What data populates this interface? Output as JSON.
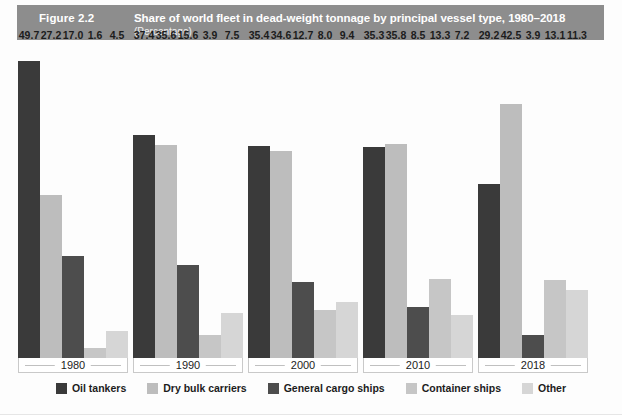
{
  "header": {
    "figure_number": "Figure 2.2",
    "title": "Share of world fleet in dead-weight tonnage by principal vessel type, 1980–2018",
    "subtitle": "(Percentage)",
    "banner_color": "#8d8d8d",
    "text_color": "#ffffff"
  },
  "chart_data": {
    "type": "bar",
    "title": "Share of world fleet in dead-weight tonnage by principal vessel type, 1980–2018",
    "subtitle": "(Percentage)",
    "xlabel": "",
    "ylabel": "",
    "ylim": [
      0,
      50
    ],
    "grid": false,
    "legend_position": "bottom",
    "value_labels": true,
    "categories": [
      "1980",
      "1990",
      "2000",
      "2010",
      "2018"
    ],
    "series": [
      {
        "name": "Oil tankers",
        "color": "#3a3a3a",
        "values": [
          49.7,
          37.4,
          35.4,
          35.3,
          29.2
        ]
      },
      {
        "name": "Dry bulk carriers",
        "color": "#bdbdbd",
        "values": [
          27.2,
          35.6,
          34.6,
          35.8,
          42.5
        ]
      },
      {
        "name": "General cargo ships",
        "color": "#4d4d4d",
        "values": [
          17.0,
          15.6,
          12.7,
          8.5,
          3.9
        ]
      },
      {
        "name": "Container ships",
        "color": "#c6c6c6",
        "values": [
          1.6,
          3.9,
          8.0,
          13.3,
          13.1
        ]
      },
      {
        "name": "Other",
        "color": "#d6d6d6",
        "values": [
          4.5,
          7.5,
          9.4,
          7.2,
          11.3
        ]
      }
    ],
    "value_labels_formatted": [
      [
        "49.7",
        "27.2",
        "17.0",
        "1.6",
        "4.5"
      ],
      [
        "37.4",
        "35.6",
        "15.6",
        "3.9",
        "7.5"
      ],
      [
        "35.4",
        "34.6",
        "12.7",
        "8.0",
        "9.4"
      ],
      [
        "35.3",
        "35.8",
        "8.5",
        "13.3",
        "7.2"
      ],
      [
        "29.2",
        "42.5",
        "3.9",
        "13.1",
        "11.3"
      ]
    ]
  },
  "legend": {
    "items": [
      {
        "label": "Oil tankers",
        "color": "#3a3a3a"
      },
      {
        "label": "Dry bulk carriers",
        "color": "#bdbdbd"
      },
      {
        "label": "General cargo ships",
        "color": "#4d4d4d"
      },
      {
        "label": "Container ships",
        "color": "#c6c6c6"
      },
      {
        "label": "Other",
        "color": "#d6d6d6"
      }
    ]
  },
  "layout": {
    "group_left_positions": [
      18,
      133,
      248,
      363,
      478
    ],
    "group_width": 110,
    "bar_width": 22,
    "plot_height_px": 297,
    "max_value": 49.7
  }
}
